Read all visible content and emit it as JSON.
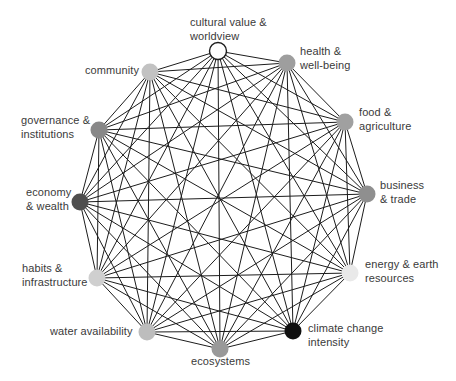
{
  "diagram": {
    "type": "network-graph",
    "connectivity": "complete",
    "background_color": "#ffffff",
    "edge_color": "#1c1c1c",
    "edge_width": 1,
    "node_radius": 8.5,
    "text_color": "#3a3a3a",
    "nodes": [
      {
        "id": "cultural-value-worldview",
        "label": "cultural value &\nworldview",
        "color": "#ffffff",
        "outline": "#1c1c1c",
        "x": 218,
        "y": 51,
        "lx": 190,
        "ly": 16
      },
      {
        "id": "health-well-being",
        "label": "health &\nwell-being",
        "color": "#9e9e9e",
        "outline": "none",
        "x": 287,
        "y": 63,
        "lx": 300,
        "ly": 45
      },
      {
        "id": "food-agriculture",
        "label": "food &\nagriculture",
        "color": "#a0a0a0",
        "outline": "none",
        "x": 345,
        "y": 122,
        "lx": 359,
        "ly": 106
      },
      {
        "id": "business-trade",
        "label": "business\n& trade",
        "color": "#8f8f8f",
        "outline": "none",
        "x": 367,
        "y": 194,
        "lx": 380,
        "ly": 179
      },
      {
        "id": "energy-earth-resources",
        "label": "energy & earth\nresources",
        "color": "#e9e9e9",
        "outline": "none",
        "x": 350,
        "y": 273,
        "lx": 365,
        "ly": 258
      },
      {
        "id": "climate-change-intensity",
        "label": "climate change\nintensity",
        "color": "#0f0f0f",
        "outline": "none",
        "x": 293,
        "y": 331,
        "lx": 308,
        "ly": 322
      },
      {
        "id": "ecosystems",
        "label": "ecosystems",
        "color": "#999999",
        "outline": "none",
        "x": 220,
        "y": 349,
        "lx": 191,
        "ly": 355
      },
      {
        "id": "water-availability",
        "label": "water availability",
        "color": "#bdbdbd",
        "outline": "none",
        "x": 147,
        "y": 332,
        "lx": 50,
        "ly": 325
      },
      {
        "id": "habits-infrastructure",
        "label": "habits &\ninfrastructure",
        "color": "#cfcfcf",
        "outline": "none",
        "x": 97,
        "y": 278,
        "lx": 22,
        "ly": 262
      },
      {
        "id": "economy-wealth",
        "label": "economy\n& wealth",
        "color": "#4f4f4f",
        "outline": "none",
        "x": 80,
        "y": 202,
        "lx": 26,
        "ly": 186
      },
      {
        "id": "governance-institutions",
        "label": "governance &\ninstitutions",
        "color": "#888888",
        "outline": "none",
        "x": 99,
        "y": 130,
        "lx": 21,
        "ly": 114
      },
      {
        "id": "community",
        "label": "community",
        "color": "#c2c2c2",
        "outline": "none",
        "x": 150,
        "y": 72,
        "lx": 85,
        "ly": 64
      }
    ]
  }
}
